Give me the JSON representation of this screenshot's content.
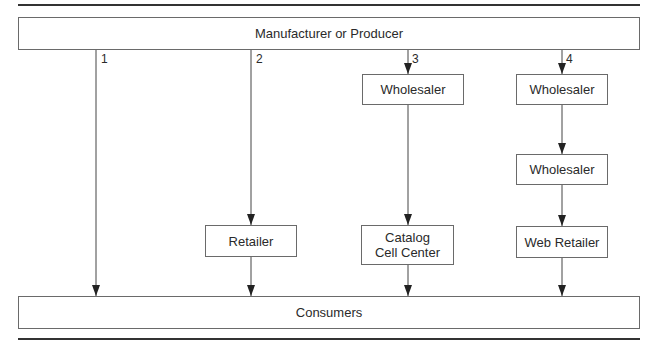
{
  "diagram": {
    "type": "distribution-channels",
    "top_node": {
      "label": "Manufacturer or Producer"
    },
    "bottom_node": {
      "label": "Consumers"
    },
    "channels": [
      {
        "number": "1",
        "intermediaries": []
      },
      {
        "number": "2",
        "intermediaries": [
          "Retailer"
        ]
      },
      {
        "number": "3",
        "intermediaries": [
          "Wholesaler",
          "Catalog Cell Center"
        ]
      },
      {
        "number": "4",
        "intermediaries": [
          "Wholesaler",
          "Wholesaler",
          "Web Retailer"
        ]
      }
    ],
    "nodes": {
      "retailer": "Retailer",
      "wholesaler_3": "Wholesaler",
      "catalog": "Catalog Cell Center",
      "wholesaler_4a": "Wholesaler",
      "wholesaler_4b": "Wholesaler",
      "web_retailer": "Web Retailer"
    },
    "colors": {
      "line": "#333333",
      "box_border": "#6a6a6a",
      "text": "#2a2a2a"
    }
  }
}
